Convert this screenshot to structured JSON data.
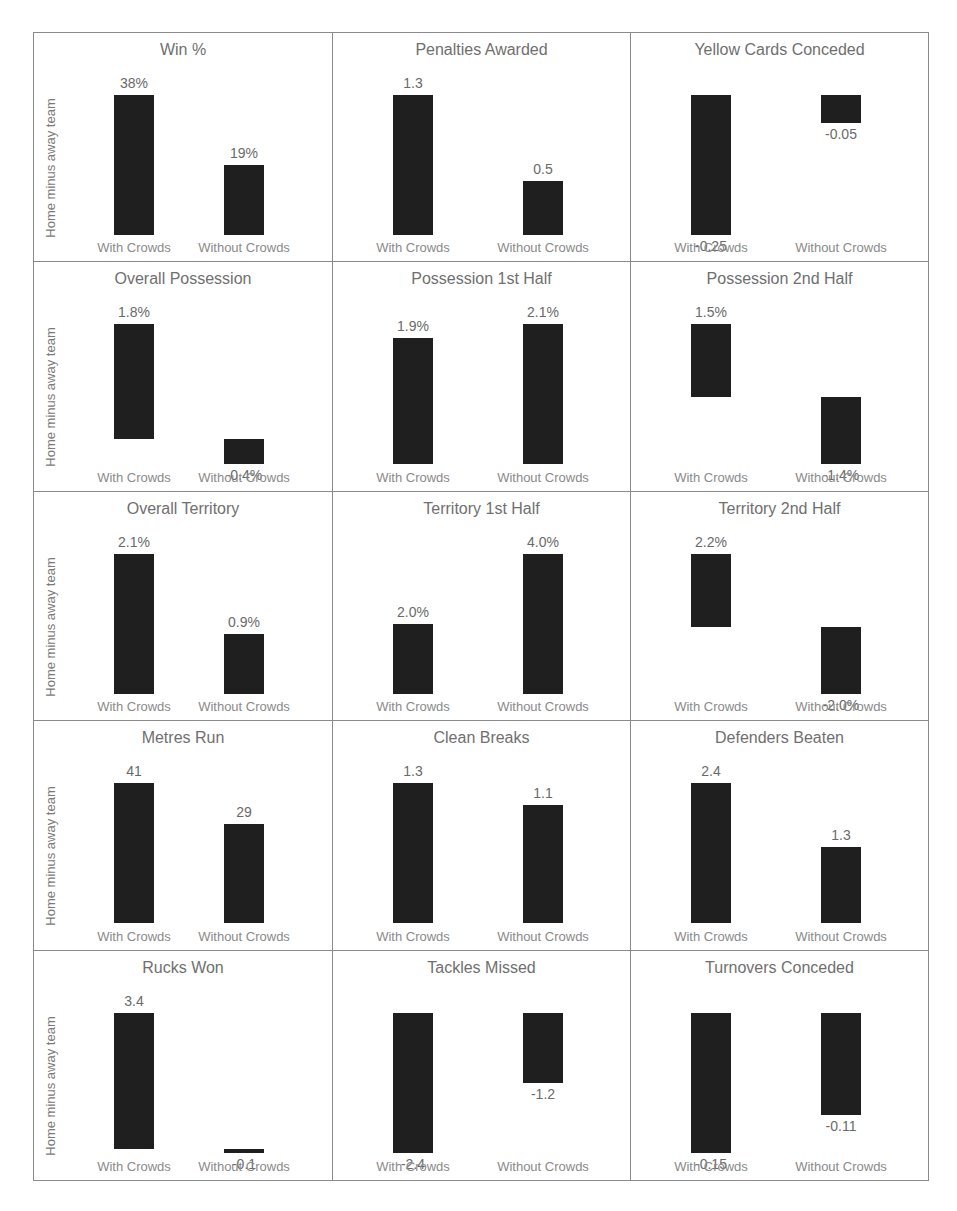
{
  "figure": {
    "ylabel": "Home minus away team",
    "categories": [
      "With Crowds",
      "Without Crowds"
    ]
  },
  "chart_data": [
    {
      "type": "bar",
      "title": "Win %",
      "categories": [
        "With Crowds",
        "Without Crowds"
      ],
      "values": [
        38,
        19
      ],
      "labels": [
        "38%",
        "19%"
      ],
      "ylabel": "Home minus away team",
      "unit": "%"
    },
    {
      "type": "bar",
      "title": "Penalties Awarded",
      "categories": [
        "With Crowds",
        "Without Crowds"
      ],
      "values": [
        1.3,
        0.5
      ],
      "labels": [
        "1.3",
        "0.5"
      ],
      "ylabel": ""
    },
    {
      "type": "bar",
      "title": "Yellow Cards Conceded",
      "categories": [
        "With Crowds",
        "Without Crowds"
      ],
      "values": [
        -0.25,
        -0.05
      ],
      "labels": [
        "-0.25",
        "-0.05"
      ],
      "ylabel": ""
    },
    {
      "type": "bar",
      "title": "Overall Possession",
      "categories": [
        "With Crowds",
        "Without Crowds"
      ],
      "values": [
        1.8,
        -0.4
      ],
      "labels": [
        "1.8%",
        "-0.4%"
      ],
      "ylabel": "Home minus away team",
      "unit": "%"
    },
    {
      "type": "bar",
      "title": "Possession 1st Half",
      "categories": [
        "With Crowds",
        "Without Crowds"
      ],
      "values": [
        1.9,
        2.1
      ],
      "labels": [
        "1.9%",
        "2.1%"
      ],
      "ylabel": "",
      "unit": "%"
    },
    {
      "type": "bar",
      "title": "Possession 2nd Half",
      "categories": [
        "With Crowds",
        "Without Crowds"
      ],
      "values": [
        1.5,
        -1.4
      ],
      "labels": [
        "1.5%",
        "-1.4%"
      ],
      "ylabel": "",
      "unit": "%"
    },
    {
      "type": "bar",
      "title": "Overall Territory",
      "categories": [
        "With Crowds",
        "Without Crowds"
      ],
      "values": [
        2.1,
        0.9
      ],
      "labels": [
        "2.1%",
        "0.9%"
      ],
      "ylabel": "Home minus away team",
      "unit": "%"
    },
    {
      "type": "bar",
      "title": "Territory 1st Half",
      "categories": [
        "With Crowds",
        "Without Crowds"
      ],
      "values": [
        2.0,
        4.0
      ],
      "labels": [
        "2.0%",
        "4.0%"
      ],
      "ylabel": "",
      "unit": "%"
    },
    {
      "type": "bar",
      "title": "Territory 2nd Half",
      "categories": [
        "With Crowds",
        "Without Crowds"
      ],
      "values": [
        2.2,
        -2.0
      ],
      "labels": [
        "2.2%",
        "-2.0%"
      ],
      "ylabel": "",
      "unit": "%"
    },
    {
      "type": "bar",
      "title": "Metres Run",
      "categories": [
        "With Crowds",
        "Without Crowds"
      ],
      "values": [
        41,
        29
      ],
      "labels": [
        "41",
        "29"
      ],
      "ylabel": "Home minus away team"
    },
    {
      "type": "bar",
      "title": "Clean Breaks",
      "categories": [
        "With Crowds",
        "Without Crowds"
      ],
      "values": [
        1.3,
        1.1
      ],
      "labels": [
        "1.3",
        "1.1"
      ],
      "ylabel": ""
    },
    {
      "type": "bar",
      "title": "Defenders Beaten",
      "categories": [
        "With Crowds",
        "Without Crowds"
      ],
      "values": [
        2.4,
        1.3
      ],
      "labels": [
        "2.4",
        "1.3"
      ],
      "ylabel": ""
    },
    {
      "type": "bar",
      "title": "Rucks Won",
      "categories": [
        "With Crowds",
        "Without Crowds"
      ],
      "values": [
        3.4,
        -0.1
      ],
      "labels": [
        "3.4",
        "-0.1"
      ],
      "ylabel": "Home minus away team"
    },
    {
      "type": "bar",
      "title": "Tackles Missed",
      "categories": [
        "With Crowds",
        "Without Crowds"
      ],
      "values": [
        -2.4,
        -1.2
      ],
      "labels": [
        "-2.4",
        "-1.2"
      ],
      "ylabel": ""
    },
    {
      "type": "bar",
      "title": "Turnovers Conceded",
      "categories": [
        "With Crowds",
        "Without Crowds"
      ],
      "values": [
        -0.15,
        -0.11
      ],
      "labels": [
        "-0.15",
        "-0.11"
      ],
      "ylabel": ""
    }
  ],
  "colors": {
    "bar": "#1f1f1f",
    "text": "#6f6f6f",
    "border": "#8a8a8a"
  }
}
